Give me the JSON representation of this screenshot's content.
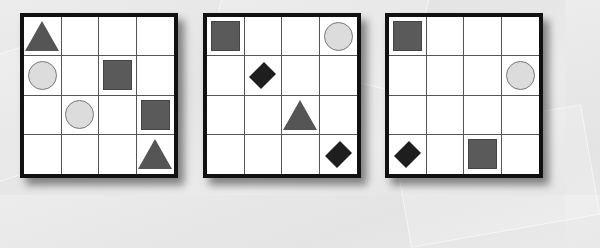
{
  "colors": {
    "background": "#e8e8e8",
    "grid_border": "#111111",
    "square": "#5a5a5a",
    "circle": "#dcdcdc",
    "triangle": "#555555",
    "diamond": "#1e1e1e"
  },
  "grids": [
    {
      "id": "grid-1",
      "rows": 4,
      "cols": 4,
      "shapes": [
        {
          "type": "triangle",
          "row": 0,
          "col": 0
        },
        {
          "type": "circle",
          "row": 1,
          "col": 0
        },
        {
          "type": "square",
          "row": 1,
          "col": 2
        },
        {
          "type": "circle",
          "row": 2,
          "col": 1
        },
        {
          "type": "square",
          "row": 2,
          "col": 3
        },
        {
          "type": "triangle",
          "row": 3,
          "col": 3
        }
      ]
    },
    {
      "id": "grid-2",
      "rows": 4,
      "cols": 4,
      "shapes": [
        {
          "type": "square",
          "row": 0,
          "col": 0
        },
        {
          "type": "circle",
          "row": 0,
          "col": 3
        },
        {
          "type": "diamond",
          "row": 1,
          "col": 1
        },
        {
          "type": "triangle",
          "row": 2,
          "col": 2
        },
        {
          "type": "diamond",
          "row": 3,
          "col": 3
        }
      ]
    },
    {
      "id": "grid-3",
      "rows": 4,
      "cols": 4,
      "shapes": [
        {
          "type": "square",
          "row": 0,
          "col": 0
        },
        {
          "type": "circle",
          "row": 1,
          "col": 3
        },
        {
          "type": "diamond",
          "row": 3,
          "col": 0
        },
        {
          "type": "square",
          "row": 3,
          "col": 2
        }
      ]
    }
  ]
}
